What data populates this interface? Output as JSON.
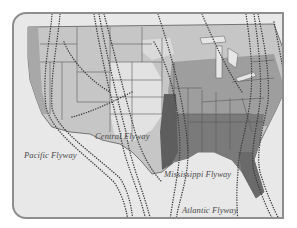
{
  "map": {
    "title": "North American Migratory Flyways",
    "colors": {
      "background": "#e8e8e8",
      "frame": "#8e8e8e",
      "land_light": "#d9d9d9",
      "land_mid": "#b4b4b4",
      "land_dark": "#8a8a8a",
      "land_darkest": "#6a6a6a",
      "water": "#e4e4e4",
      "borders": "#5a5a5a",
      "flyway_dots": "#3a3a3a"
    },
    "labels": [
      {
        "id": "pacific",
        "text": "Pacific Flyway",
        "x": 22,
        "y": 148
      },
      {
        "id": "central",
        "text": "Central Flyway",
        "x": 93,
        "y": 129
      },
      {
        "id": "mississippi",
        "text": "Mississippi Flyway",
        "x": 162,
        "y": 167
      },
      {
        "id": "atlantic",
        "text": "Atlantic Flyway",
        "x": 180,
        "y": 203
      }
    ]
  }
}
